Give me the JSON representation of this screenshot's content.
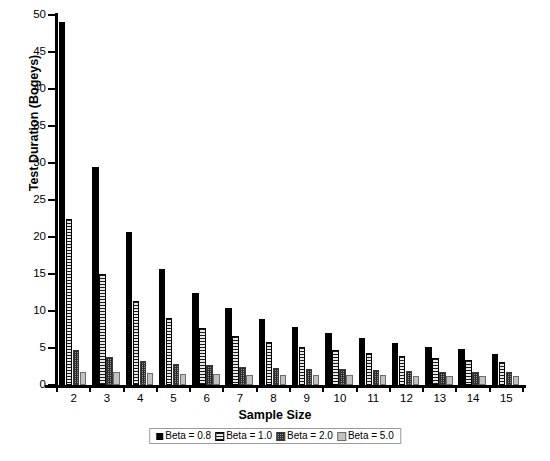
{
  "chart_data": {
    "type": "bar",
    "title": "",
    "xlabel": "Sample Size",
    "ylabel": "Test Duration (Bogeys)",
    "categories": [
      "2",
      "3",
      "4",
      "5",
      "6",
      "7",
      "8",
      "9",
      "10",
      "11",
      "12",
      "13",
      "14",
      "15"
    ],
    "ylim": [
      0,
      50
    ],
    "yticks": [
      "0",
      "5",
      "10",
      "15",
      "20",
      "25",
      "30",
      "35",
      "40",
      "45",
      "50"
    ],
    "grid": false,
    "legend_position": "bottom",
    "series": [
      {
        "name": "Beta = 0.8",
        "pattern": "solid-black",
        "color": "#000000",
        "values": [
          49.0,
          29.4,
          20.7,
          15.7,
          12.5,
          10.4,
          8.9,
          7.8,
          7.0,
          6.3,
          5.7,
          5.2,
          4.8,
          4.2
        ]
      },
      {
        "name": "Beta = 1.0",
        "pattern": "horizontal-stripes",
        "color": "#8f8f8f",
        "values": [
          22.4,
          15.0,
          11.3,
          9.1,
          7.7,
          6.6,
          5.8,
          5.2,
          4.7,
          4.3,
          3.9,
          3.6,
          3.4,
          3.1
        ]
      },
      {
        "name": "Beta = 2.0",
        "pattern": "checkered",
        "color": "#9a9a9a",
        "values": [
          4.7,
          3.8,
          3.3,
          2.9,
          2.7,
          2.5,
          2.3,
          2.2,
          2.1,
          2.0,
          1.9,
          1.8,
          1.8,
          1.7
        ]
      },
      {
        "name": "Beta = 5.0",
        "pattern": "solid-light-gray",
        "color": "#c2c2c2",
        "values": [
          1.8,
          1.7,
          1.6,
          1.5,
          1.5,
          1.4,
          1.4,
          1.3,
          1.3,
          1.3,
          1.2,
          1.2,
          1.2,
          1.2
        ]
      }
    ]
  }
}
